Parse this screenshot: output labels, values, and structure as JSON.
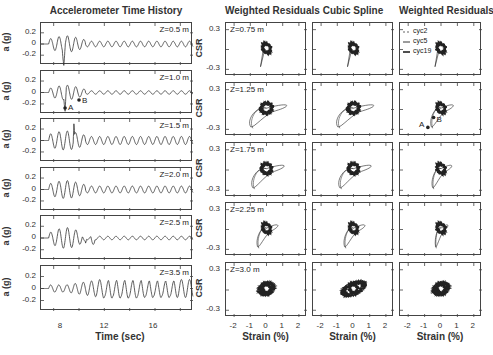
{
  "chart_data": [
    {
      "type": "line",
      "title": "Accelerometer Time History",
      "xlabel": "Time (sec)",
      "ylabel": "a (g)",
      "xlim": [
        7,
        19
      ],
      "ylim": [
        -0.35,
        0.35
      ],
      "xticks": [
        8,
        12,
        16
      ],
      "yticks": [
        0.2,
        0,
        -0.2
      ],
      "panels": [
        {
          "label": "Z=0.5 m",
          "annotations": []
        },
        {
          "label": "Z=1.0 m",
          "annotations": [
            {
              "text": "A",
              "x": 9.0,
              "y": -0.27
            },
            {
              "text": "B",
              "x": 10.0,
              "y": -0.13
            }
          ]
        },
        {
          "label": "Z=1.5 m",
          "annotations": []
        },
        {
          "label": "Z=2.0 m",
          "annotations": []
        },
        {
          "label": "Z=2.5 m",
          "annotations": []
        },
        {
          "label": "Z=3.5 m",
          "annotations": []
        }
      ]
    },
    {
      "type": "line",
      "title": "Weighted Residuals",
      "xlabel": "Strain (%)",
      "ylabel": "CSR",
      "xlim": [
        -2.5,
        2.5
      ],
      "ylim": [
        -0.4,
        0.4
      ],
      "xticks": [
        -2,
        -1,
        0,
        1,
        2
      ],
      "yticks": [
        0.3,
        -0.3
      ],
      "panels": [
        "Z=0.75 m",
        "Z=1.25 m",
        "Z=1.75 m",
        "Z=2.25 m",
        "Z=3.0 m"
      ]
    },
    {
      "type": "line",
      "title": "Cubic Spline",
      "xlabel": "Strain (%)",
      "ylabel": "",
      "xlim": [
        -2.5,
        2.5
      ],
      "ylim": [
        -0.4,
        0.4
      ],
      "xticks": [
        -2,
        -1,
        0,
        1,
        2
      ],
      "panels": [
        "Z=0.75 m",
        "Z=1.25 m",
        "Z=1.75 m",
        "Z=2.25 m",
        "Z=3.0 m"
      ]
    },
    {
      "type": "line",
      "title": "Weighted Residuals",
      "xlabel": "Strain (%)",
      "ylabel": "",
      "xlim": [
        -2.5,
        2.5
      ],
      "ylim": [
        -0.4,
        0.4
      ],
      "xticks": [
        -2,
        -1,
        0,
        1,
        2
      ],
      "legend": [
        "cyc2",
        "cyc5",
        "cyc19"
      ],
      "legend_position": "upper left",
      "annotations": [
        {
          "text": "A",
          "x": -0.8,
          "y": -0.25
        },
        {
          "text": "B",
          "x": -0.4,
          "y": -0.1
        }
      ]
    }
  ],
  "titles": {
    "left": "Accelerometer Time History",
    "wr": "Weighted Residuals",
    "cs": "Cubic Spline",
    "wr2": "Weighted Residuals"
  },
  "left_ylabel": "a (g)",
  "left_yticks": [
    "0.2",
    "0",
    "-0.2"
  ],
  "left_xticks": [
    "8",
    "12",
    "16"
  ],
  "left_xlabel": "Time (sec)",
  "left_panels": [
    "Z=0.5 m",
    "Z=1.0 m",
    "Z=1.5 m",
    "Z=2.0 m",
    "Z=2.5 m",
    "Z=3.5 m"
  ],
  "right_ylabel": "CSR",
  "right_yticks": [
    "0.3",
    "-0.3"
  ],
  "right_xticks": [
    "-2",
    "-1",
    "0",
    "1",
    "2"
  ],
  "right_xlabel": "Strain (%)",
  "right_panels": [
    "Z=0.75 m",
    "Z=1.25 m",
    "Z=1.75 m",
    "Z=2.25 m",
    "Z=3.0 m"
  ],
  "legend": {
    "cyc2": "cyc2",
    "cyc5": "cyc5",
    "cyc19": "cyc19"
  },
  "markers": {
    "a": "A",
    "b": "B"
  }
}
